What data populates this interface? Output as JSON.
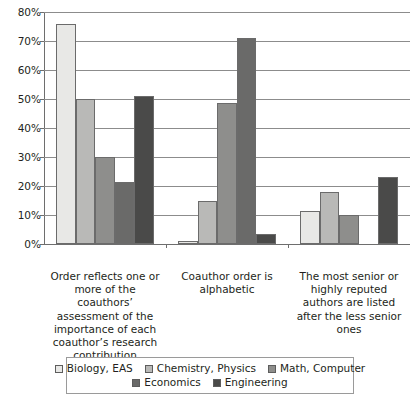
{
  "chart_data": {
    "type": "bar",
    "title": "",
    "subtitle": "",
    "xlabel": "",
    "ylabel": "",
    "ylim": [
      0,
      80
    ],
    "ytick_values": [
      0,
      10,
      20,
      30,
      40,
      50,
      60,
      70,
      80
    ],
    "ytick_labels": [
      "0%",
      "10%",
      "20%",
      "30%",
      "40%",
      "50%",
      "60%",
      "70%",
      "80%"
    ],
    "grid": true,
    "grid_axis": "y",
    "legend_position": "bottom",
    "value_format": "percent",
    "categories": [
      "Order reflects one or more of the coauthors’ assessment of the importance of each coauthor’s research contribution",
      "Coauthor order is alphabetic",
      "The most senior or highly reputed authors are listed after the less senior ones"
    ],
    "series": [
      {
        "name": "Biology, EAS",
        "color": "#e8e8e6",
        "values": [
          76.0,
          1.0,
          11.5
        ]
      },
      {
        "name": "Chemistry, Physics",
        "color": "#b9b9b7",
        "values": [
          50.0,
          15.0,
          18.0
        ]
      },
      {
        "name": "Math, Computer",
        "color": "#8e8e8c",
        "values": [
          30.0,
          48.5,
          10.0
        ]
      },
      {
        "name": "Economics",
        "color": "#6a6a69",
        "values": [
          21.5,
          71.0,
          0.0
        ]
      },
      {
        "name": "Engineering",
        "color": "#4a4a49",
        "values": [
          51.0,
          3.5,
          23.0
        ]
      }
    ],
    "legend_rows": [
      [
        "Biology, EAS",
        "Chemistry, Physics",
        "Math, Computer"
      ],
      [
        "Economics",
        "Engineering"
      ]
    ],
    "axis_color": "#6e6e6e",
    "gridline_color": "#8c8c8c",
    "bar_border_color": "#6b6b6b",
    "text_color": "#231f20",
    "background_color": "#ffffff"
  }
}
